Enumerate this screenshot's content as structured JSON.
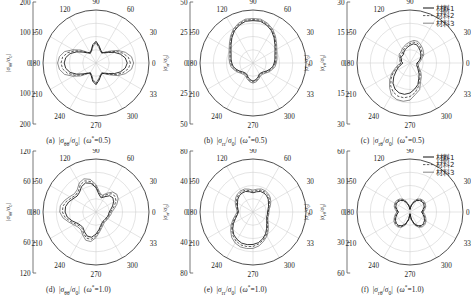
{
  "figure": {
    "panel_count": 6,
    "legend": {
      "position": "top-right",
      "entries": [
        {
          "label": "材料1",
          "style": "solid"
        },
        {
          "label": "材料2",
          "style": "dashed"
        },
        {
          "label": "材料3",
          "style": "solid-thin"
        }
      ]
    },
    "angles": [
      "0",
      "30",
      "60",
      "90",
      "120",
      "150",
      "180",
      "210",
      "240",
      "270",
      "300",
      "330"
    ]
  },
  "chart_data": [
    {
      "id": "a",
      "type": "line",
      "subtype": "polar",
      "caption_index": "(a)",
      "caption_quantity": "|σθθ/σ0|",
      "caption_param": "(ω*=0.5)",
      "ylabel": "|σθθ/σ0|",
      "rmax": 200,
      "radial_ticks": [
        200,
        100,
        0,
        100,
        200
      ],
      "grid": true,
      "legend_shown": false,
      "theta": [
        0,
        10,
        20,
        30,
        40,
        50,
        60,
        70,
        80,
        90,
        100,
        110,
        120,
        130,
        140,
        150,
        160,
        170,
        180,
        190,
        200,
        210,
        220,
        230,
        240,
        250,
        260,
        270,
        280,
        290,
        300,
        310,
        320,
        330,
        340,
        350
      ],
      "series": [
        {
          "name": "材料1",
          "values": [
            118,
            112,
            98,
            80,
            62,
            50,
            45,
            52,
            66,
            82,
            70,
            52,
            44,
            50,
            64,
            84,
            104,
            116,
            120,
            116,
            104,
            84,
            64,
            50,
            44,
            52,
            70,
            82,
            66,
            52,
            45,
            50,
            62,
            80,
            98,
            112
          ]
        },
        {
          "name": "材料2",
          "values": [
            130,
            124,
            108,
            88,
            66,
            52,
            44,
            50,
            63,
            78,
            67,
            50,
            43,
            52,
            70,
            92,
            114,
            128,
            132,
            128,
            114,
            92,
            70,
            52,
            43,
            50,
            67,
            78,
            63,
            50,
            44,
            52,
            66,
            88,
            108,
            124
          ]
        },
        {
          "name": "材料3",
          "values": [
            142,
            136,
            118,
            95,
            70,
            54,
            43,
            48,
            60,
            75,
            64,
            48,
            42,
            54,
            76,
            100,
            126,
            140,
            145,
            140,
            126,
            100,
            76,
            54,
            42,
            48,
            64,
            75,
            60,
            48,
            43,
            54,
            70,
            95,
            118,
            136
          ]
        }
      ]
    },
    {
      "id": "b",
      "type": "line",
      "subtype": "polar",
      "caption_index": "(b)",
      "caption_quantity": "|σrr/σ0|",
      "caption_param": "(ω*=0.5)",
      "ylabel": "|σrr/σ0|",
      "ylabel_right": "|σrr/σ0|",
      "rmax": 50,
      "radial_ticks": [
        50,
        25,
        0,
        25,
        50
      ],
      "grid": true,
      "legend_shown": false,
      "theta": [
        0,
        10,
        20,
        30,
        40,
        50,
        60,
        70,
        80,
        90,
        100,
        110,
        120,
        130,
        140,
        150,
        160,
        170,
        180,
        190,
        200,
        210,
        220,
        230,
        240,
        250,
        260,
        270,
        280,
        290,
        300,
        310,
        320,
        330,
        340,
        350
      ],
      "series": [
        {
          "name": "材料1",
          "values": [
            20,
            21,
            22,
            24,
            27,
            31,
            35,
            38,
            40,
            40,
            40,
            38,
            35,
            31,
            27,
            24,
            22,
            21,
            20,
            19,
            17,
            15,
            13,
            12,
            12,
            14,
            16,
            17,
            16,
            14,
            12,
            12,
            13,
            15,
            17,
            19
          ]
        },
        {
          "name": "材料2",
          "values": [
            21,
            22,
            23,
            25,
            28,
            32,
            36,
            39,
            41,
            41,
            41,
            39,
            36,
            32,
            28,
            25,
            23,
            22,
            21,
            20,
            18,
            16,
            14,
            13,
            13,
            15,
            17,
            18,
            17,
            15,
            13,
            13,
            14,
            16,
            18,
            20
          ]
        },
        {
          "name": "材料3",
          "values": [
            22,
            23,
            24,
            26,
            29,
            33,
            37,
            40,
            42,
            42,
            42,
            40,
            37,
            33,
            29,
            26,
            24,
            23,
            22,
            21,
            19,
            17,
            15,
            14,
            14,
            16,
            18,
            19,
            18,
            16,
            14,
            14,
            15,
            17,
            19,
            21
          ]
        }
      ]
    },
    {
      "id": "c",
      "type": "line",
      "subtype": "polar",
      "caption_index": "(c)",
      "caption_quantity": "|σrθ/σ0|",
      "caption_param": "(ω*=0.5)",
      "ylabel": "|σrθ/σ0|",
      "rmax": 30,
      "radial_ticks": [
        30,
        15,
        0,
        15,
        30
      ],
      "grid": true,
      "legend_shown": true,
      "theta": [
        0,
        10,
        20,
        30,
        40,
        50,
        60,
        70,
        80,
        90,
        100,
        110,
        120,
        130,
        140,
        150,
        160,
        170,
        180,
        190,
        200,
        210,
        220,
        230,
        240,
        250,
        260,
        270,
        280,
        290,
        300,
        310,
        320,
        330,
        340,
        350
      ],
      "series": [
        {
          "name": "材料1",
          "values": [
            4,
            5,
            6,
            7,
            8,
            9,
            10,
            11,
            11,
            10,
            9,
            8,
            7,
            6,
            6,
            6,
            5,
            5,
            4,
            5,
            7,
            9,
            12,
            15,
            17,
            18,
            18,
            17,
            15,
            13,
            10,
            8,
            6,
            5,
            4,
            4
          ]
        },
        {
          "name": "材料2",
          "values": [
            4,
            5,
            6,
            8,
            9,
            10,
            11,
            12,
            12,
            11,
            10,
            9,
            8,
            7,
            7,
            6,
            6,
            5,
            5,
            6,
            8,
            11,
            14,
            17,
            19,
            20,
            20,
            19,
            17,
            14,
            11,
            9,
            7,
            5,
            5,
            4
          ]
        },
        {
          "name": "材料3",
          "values": [
            5,
            6,
            7,
            9,
            10,
            11,
            12,
            13,
            13,
            12,
            11,
            10,
            9,
            8,
            8,
            7,
            6,
            6,
            5,
            7,
            9,
            12,
            15,
            18,
            21,
            22,
            22,
            21,
            18,
            16,
            12,
            10,
            8,
            6,
            5,
            5
          ]
        }
      ]
    },
    {
      "id": "d",
      "type": "line",
      "subtype": "polar",
      "caption_index": "(d)",
      "caption_quantity": "|σθθ/σ0|",
      "caption_param": "(ω*=1.0)",
      "ylabel": "|σθθ/σ0|",
      "rmax": 120,
      "radial_ticks": [
        120,
        60,
        0,
        60,
        120
      ],
      "grid": true,
      "legend_shown": false,
      "theta": [
        0,
        10,
        20,
        30,
        40,
        50,
        60,
        70,
        80,
        90,
        100,
        110,
        120,
        130,
        140,
        150,
        160,
        170,
        180,
        190,
        200,
        210,
        220,
        230,
        240,
        250,
        260,
        270,
        280,
        290,
        300,
        310,
        320,
        330,
        340,
        350
      ],
      "series": [
        {
          "name": "材料1",
          "values": [
            30,
            34,
            40,
            46,
            50,
            48,
            40,
            34,
            40,
            55,
            66,
            70,
            66,
            58,
            56,
            60,
            66,
            70,
            70,
            66,
            58,
            50,
            46,
            46,
            52,
            58,
            58,
            50,
            40,
            32,
            28,
            26,
            26,
            27,
            28,
            29
          ]
        },
        {
          "name": "材料2",
          "values": [
            33,
            38,
            45,
            52,
            56,
            54,
            45,
            37,
            43,
            58,
            70,
            75,
            71,
            62,
            60,
            64,
            71,
            76,
            76,
            71,
            62,
            54,
            49,
            49,
            56,
            63,
            63,
            54,
            43,
            35,
            30,
            28,
            28,
            29,
            30,
            31
          ]
        },
        {
          "name": "材料3",
          "values": [
            36,
            42,
            50,
            58,
            62,
            59,
            49,
            40,
            46,
            62,
            75,
            80,
            76,
            66,
            64,
            69,
            76,
            82,
            82,
            76,
            66,
            58,
            53,
            53,
            60,
            68,
            68,
            58,
            46,
            38,
            33,
            30,
            30,
            31,
            32,
            34
          ]
        }
      ]
    },
    {
      "id": "e",
      "type": "line",
      "subtype": "polar",
      "caption_index": "(e)",
      "caption_quantity": "|σrr/σ0|",
      "caption_param": "(ω*=1.0)",
      "ylabel": "|σrr/σ0|",
      "ylabel_right": "|σrr/σ0|",
      "rmax": 80,
      "radial_ticks": [
        80,
        40,
        0,
        40,
        80
      ],
      "grid": true,
      "legend_shown": false,
      "theta": [
        0,
        10,
        20,
        30,
        40,
        50,
        60,
        70,
        80,
        90,
        100,
        110,
        120,
        130,
        140,
        150,
        160,
        170,
        180,
        190,
        200,
        210,
        220,
        230,
        240,
        250,
        260,
        270,
        280,
        290,
        300,
        310,
        320,
        330,
        340,
        350
      ],
      "series": [
        {
          "name": "材料1",
          "values": [
            22,
            23,
            25,
            27,
            30,
            32,
            33,
            33,
            31,
            29,
            31,
            33,
            33,
            32,
            30,
            27,
            25,
            23,
            22,
            24,
            28,
            34,
            40,
            45,
            48,
            50,
            50,
            49,
            47,
            43,
            38,
            32,
            27,
            24,
            22,
            22
          ]
        },
        {
          "name": "材料2",
          "values": [
            23,
            24,
            26,
            29,
            32,
            34,
            35,
            35,
            33,
            31,
            33,
            35,
            35,
            34,
            32,
            29,
            26,
            24,
            23,
            25,
            30,
            36,
            42,
            47,
            51,
            53,
            53,
            52,
            49,
            45,
            40,
            34,
            29,
            25,
            23,
            23
          ]
        },
        {
          "name": "材料3",
          "values": [
            24,
            25,
            28,
            31,
            34,
            36,
            37,
            37,
            35,
            33,
            35,
            37,
            37,
            36,
            34,
            31,
            28,
            25,
            24,
            27,
            32,
            38,
            44,
            50,
            54,
            56,
            56,
            55,
            52,
            47,
            42,
            36,
            30,
            26,
            24,
            24
          ]
        }
      ]
    },
    {
      "id": "f",
      "type": "line",
      "subtype": "polar",
      "caption_index": "(f)",
      "caption_quantity": "|σrθ/σ0|",
      "caption_param": "(ω*=1.0)",
      "ylabel": "|σrθ/σ0|",
      "rmax": 60,
      "radial_ticks": [
        60,
        30,
        0,
        30,
        60
      ],
      "grid": true,
      "legend_shown": true,
      "theta": [
        0,
        10,
        20,
        30,
        40,
        50,
        60,
        70,
        80,
        90,
        100,
        110,
        120,
        130,
        140,
        150,
        160,
        170,
        180,
        190,
        200,
        210,
        220,
        230,
        240,
        250,
        260,
        270,
        280,
        290,
        300,
        310,
        320,
        330,
        340,
        350
      ],
      "series": [
        {
          "name": "材料1",
          "values": [
            13,
            15,
            17,
            18,
            18,
            17,
            15,
            11,
            7,
            3,
            7,
            11,
            15,
            17,
            18,
            18,
            17,
            15,
            13,
            15,
            17,
            19,
            20,
            20,
            18,
            14,
            8,
            2,
            8,
            14,
            18,
            20,
            20,
            19,
            17,
            15
          ]
        },
        {
          "name": "材料2",
          "values": [
            14,
            16,
            18,
            19,
            19,
            18,
            16,
            12,
            7,
            3,
            7,
            12,
            16,
            18,
            19,
            19,
            18,
            16,
            14,
            16,
            18,
            20,
            21,
            21,
            19,
            15,
            9,
            2,
            9,
            15,
            19,
            21,
            21,
            20,
            18,
            16
          ]
        },
        {
          "name": "材料3",
          "values": [
            15,
            17,
            19,
            20,
            20,
            19,
            17,
            13,
            8,
            3,
            8,
            13,
            17,
            19,
            20,
            20,
            19,
            17,
            15,
            17,
            19,
            21,
            22,
            22,
            20,
            16,
            9,
            2,
            9,
            16,
            20,
            22,
            22,
            21,
            19,
            17
          ]
        }
      ]
    }
  ]
}
